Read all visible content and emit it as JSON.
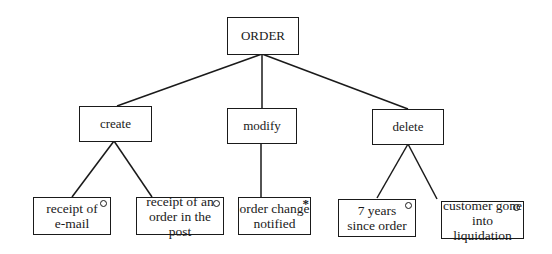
{
  "diagram": {
    "root": {
      "label": "ORDER"
    },
    "events": [
      {
        "label": "create",
        "children": [
          {
            "label_line1": "receipt of",
            "label_line2": "e-mail",
            "marker": "circle"
          },
          {
            "label_line1": "receipt of an",
            "label_line2": "order in the post",
            "marker": "circle"
          }
        ]
      },
      {
        "label": "modify",
        "children": [
          {
            "label_line1": "order change",
            "label_line2": "notified",
            "marker": "asterisk",
            "marker_symbol": "*"
          }
        ]
      },
      {
        "label": "delete",
        "children": [
          {
            "label_line1": "7 years",
            "label_line2": "since order",
            "marker": "circle"
          },
          {
            "label_line1": "customer gone",
            "label_line2": "into liquidation",
            "marker": "circle"
          }
        ]
      }
    ],
    "colors": {
      "line": "#1a1a1a",
      "background": "#ffffff"
    }
  }
}
